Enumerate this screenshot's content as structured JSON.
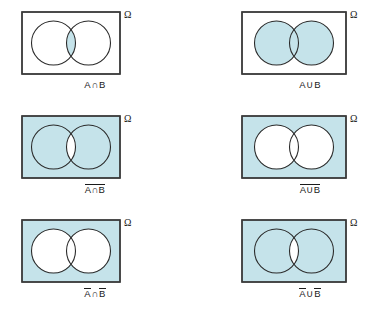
{
  "figure": {
    "universe_label": "Ω",
    "set_a_label": "A",
    "set_b_label": "B",
    "colors": {
      "shade": "#c5e3ea",
      "stroke": "#3a3a3a",
      "circle_stroke": "#2b2b2b",
      "text": "#1a1a1a",
      "background": "#ffffff"
    },
    "panels": [
      {
        "id": "a-intersect-b",
        "row": 0,
        "column": 0,
        "caption_parts": [
          {
            "text": "A",
            "overline": false
          },
          {
            "text": "∩",
            "overline": false,
            "operator": true
          },
          {
            "text": "B",
            "overline": false
          }
        ],
        "caption_plain": "A∩B",
        "shaded_region": "intersection-lens-only",
        "rect_filled": false,
        "circle_a_filled": false,
        "circle_b_filled": false,
        "lens_filled": true
      },
      {
        "id": "a-union-b",
        "row": 0,
        "column": 1,
        "caption_parts": [
          {
            "text": "A",
            "overline": false
          },
          {
            "text": "∪",
            "overline": false,
            "operator": true
          },
          {
            "text": "B",
            "overline": false
          }
        ],
        "caption_plain": "A∪B",
        "shaded_region": "both-circles",
        "rect_filled": false,
        "circle_a_filled": true,
        "circle_b_filled": true,
        "lens_filled": true
      },
      {
        "id": "complement-of-a-intersect-b",
        "row": 1,
        "column": 0,
        "caption_parts": [
          {
            "text": "A∩B",
            "overline": true
          }
        ],
        "caption_plain": "̅A∩B with overline",
        "shaded_region": "everything-except-lens",
        "rect_filled": true,
        "circle_a_filled": true,
        "circle_b_filled": true,
        "lens_filled": false
      },
      {
        "id": "complement-of-a-union-b",
        "row": 1,
        "column": 1,
        "caption_parts": [
          {
            "text": "A∪B",
            "overline": true
          }
        ],
        "caption_plain": "A∪B with overline",
        "shaded_region": "outside-both-circles",
        "rect_filled": true,
        "circle_a_filled": false,
        "circle_b_filled": false,
        "lens_filled": false
      },
      {
        "id": "not-a-intersect-not-b",
        "row": 2,
        "column": 0,
        "caption_parts": [
          {
            "text": "A",
            "overline": true
          },
          {
            "text": "∩",
            "overline": false,
            "operator": true
          },
          {
            "text": "B",
            "overline": true
          }
        ],
        "caption_plain": "Ā∩B̄",
        "shaded_region": "outside-both-circles",
        "rect_filled": true,
        "circle_a_filled": false,
        "circle_b_filled": false,
        "lens_filled": false
      },
      {
        "id": "not-a-union-not-b",
        "row": 2,
        "column": 1,
        "caption_parts": [
          {
            "text": "A",
            "overline": true
          },
          {
            "text": "∪",
            "overline": false,
            "operator": true
          },
          {
            "text": "B",
            "overline": true
          }
        ],
        "caption_plain": "Ā∪B̄",
        "shaded_region": "everything-except-lens",
        "rect_filled": true,
        "circle_a_filled": true,
        "circle_b_filled": true,
        "lens_filled": false
      }
    ]
  }
}
